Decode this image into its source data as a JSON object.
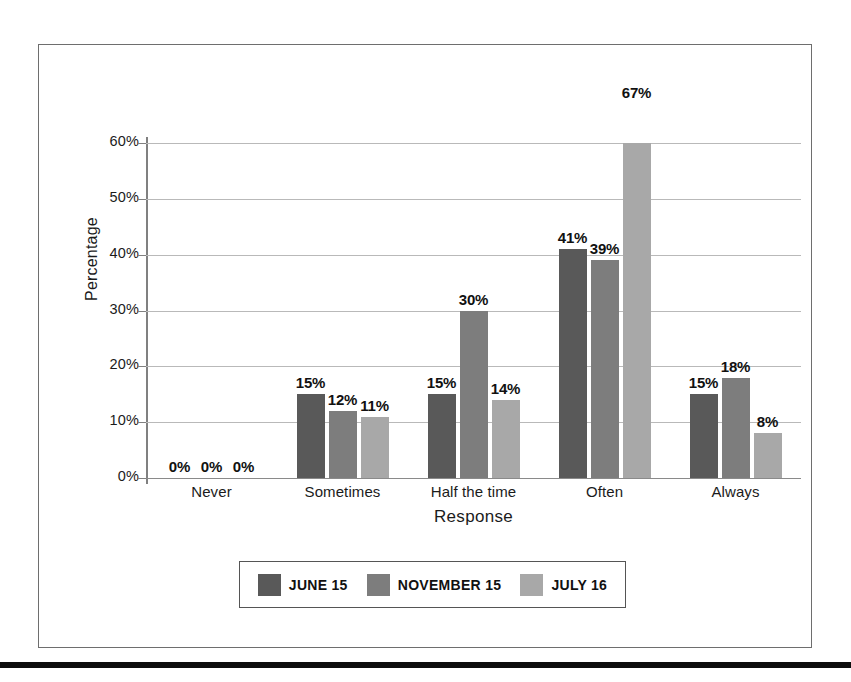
{
  "chart_data": {
    "type": "bar",
    "title": "",
    "xlabel": "Response",
    "ylabel": "Percentage",
    "categories": [
      "Never",
      "Sometimes",
      "Half the time",
      "Often",
      "Always"
    ],
    "series": [
      {
        "name": "JUNE 15",
        "color": "#595959",
        "values": [
          0,
          15,
          15,
          41,
          15
        ]
      },
      {
        "name": "NOVEMBER 15",
        "color": "#7d7d7d",
        "values": [
          0,
          12,
          30,
          39,
          18
        ]
      },
      {
        "name": "JULY 16",
        "color": "#a8a8a8",
        "values": [
          0,
          11,
          14,
          67,
          8
        ]
      }
    ],
    "value_labels": [
      [
        "0%",
        "0%",
        "0%"
      ],
      [
        "15%",
        "12%",
        "11%"
      ],
      [
        "15%",
        "30%",
        "14%"
      ],
      [
        "41%",
        "39%",
        "67%"
      ],
      [
        "15%",
        "18%",
        "8%"
      ]
    ],
    "ylim": [
      0,
      60
    ],
    "yticks": [
      0,
      10,
      20,
      30,
      40,
      50,
      60
    ],
    "ytick_labels": [
      "0%",
      "10%",
      "20%",
      "30%",
      "40%",
      "50%",
      "60%"
    ],
    "grid": true,
    "legend_position": "bottom"
  },
  "legend": {
    "items": [
      {
        "label": "JUNE 15",
        "color": "#595959"
      },
      {
        "label": "NOVEMBER 15",
        "color": "#7d7d7d"
      },
      {
        "label": "JULY 16",
        "color": "#a8a8a8"
      }
    ]
  }
}
